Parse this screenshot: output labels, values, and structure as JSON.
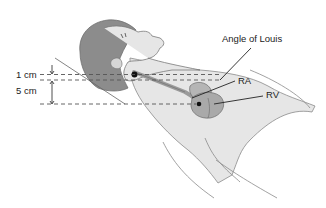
{
  "diagram": {
    "type": "anatomical-illustration",
    "labels": {
      "angle_of_louis": "Angle of Louis",
      "ra": "RA",
      "rv": "RV",
      "measure_1cm": "1 cm",
      "measure_5cm": "5 cm"
    },
    "colors": {
      "skin": "#e6e6e6",
      "hair": "#8c8c8c",
      "heart": "#a9a9a9",
      "outline": "#7a7a7a",
      "line": "#222222",
      "dashed": "#555555"
    }
  }
}
